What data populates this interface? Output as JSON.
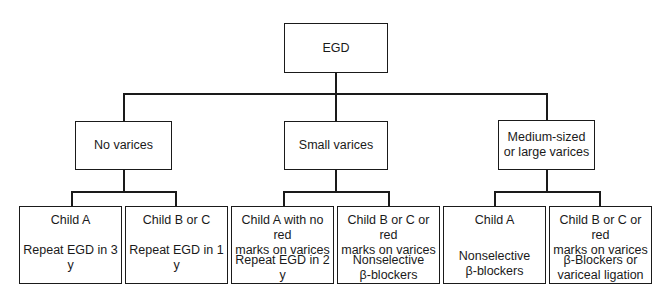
{
  "root": {
    "label": "EGD"
  },
  "branches": [
    {
      "label": [
        "No varices"
      ],
      "leaves": [
        {
          "condition": [
            "Child A"
          ],
          "action": [
            "Repeat EGD in 3 y"
          ]
        },
        {
          "condition": [
            "Child B or C"
          ],
          "action": [
            "Repeat EGD in 1 y"
          ]
        }
      ]
    },
    {
      "label": [
        "Small varices"
      ],
      "leaves": [
        {
          "condition": [
            "Child A with no red",
            "marks on varices"
          ],
          "action": [
            "Repeat EGD in 2 y"
          ]
        },
        {
          "condition": [
            "Child B or C or red",
            "marks on varices"
          ],
          "action": [
            "Nonselective",
            "β-blockers"
          ]
        }
      ]
    },
    {
      "label": [
        "Medium-sized",
        "or large varices"
      ],
      "leaves": [
        {
          "condition": [
            "Child A"
          ],
          "action": [
            "Nonselective",
            "β-blockers"
          ]
        },
        {
          "condition": [
            "Child B or C or red",
            "marks on varices"
          ],
          "action": [
            "β-Blockers or",
            "variceal ligation"
          ]
        }
      ]
    }
  ]
}
